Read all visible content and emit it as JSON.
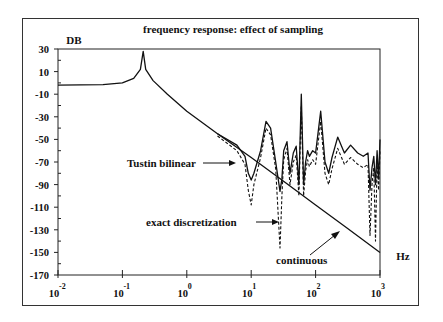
{
  "chart_data": {
    "type": "line",
    "title": "frequency response: effect of sampling",
    "ylabel": "DB",
    "xlabel": "Hz",
    "xscale": "log",
    "xlim": [
      0.01,
      1000
    ],
    "ylim": [
      -170,
      30
    ],
    "y_ticks": [
      30,
      10,
      -10,
      -30,
      -50,
      -70,
      -90,
      -110,
      -130,
      -150,
      -170
    ],
    "x_ticks": [
      {
        "base": "10",
        "exp": "-2"
      },
      {
        "base": "10",
        "exp": "-1"
      },
      {
        "base": "10",
        "exp": "0"
      },
      {
        "base": "10",
        "exp": "1"
      },
      {
        "base": "10",
        "exp": "2"
      },
      {
        "base": "10",
        "exp": "3"
      }
    ],
    "grid": false,
    "annotations": [
      {
        "text": "Tustin bilinear",
        "points_to": "Tustin bilinear curve near 8 Hz"
      },
      {
        "text": "exact discretization",
        "points_to": "dashed curve near 30 Hz"
      },
      {
        "text": "continuous",
        "points_to": "straight roll-off line near 300 Hz"
      }
    ],
    "series": [
      {
        "name": "continuous",
        "style": "solid",
        "x": [
          0.01,
          0.05,
          0.1,
          0.15,
          0.19,
          0.21,
          0.23,
          0.3,
          0.5,
          1,
          3,
          10,
          30,
          100,
          300,
          1000
        ],
        "y": [
          -2,
          -1.5,
          0,
          4,
          12,
          28,
          12,
          2,
          -10,
          -25,
          -45,
          -66,
          -86,
          -108,
          -128,
          -150
        ]
      },
      {
        "name": "Tustin bilinear",
        "style": "solid",
        "x": [
          3,
          6,
          8,
          9,
          10,
          11,
          14,
          17,
          20,
          24,
          28,
          30,
          32,
          36,
          40,
          45,
          50,
          55,
          60,
          65,
          70,
          75,
          80,
          90,
          100,
          120,
          140,
          160,
          180,
          220,
          280,
          350,
          450,
          550,
          650,
          700,
          750,
          800,
          850,
          900,
          950,
          1000
        ],
        "y": [
          -45,
          -55,
          -65,
          -80,
          -86,
          -80,
          -60,
          -34,
          -40,
          -70,
          -96,
          -85,
          -60,
          -52,
          -80,
          -62,
          -56,
          -90,
          -10,
          -90,
          -70,
          -60,
          -65,
          -60,
          -62,
          -25,
          -70,
          -80,
          -66,
          -48,
          -62,
          -55,
          -62,
          -65,
          -62,
          -95,
          -75,
          -65,
          -90,
          -60,
          -85,
          -50
        ]
      },
      {
        "name": "exact discretization",
        "style": "dashed",
        "x": [
          3,
          6,
          8,
          9,
          10,
          11,
          14,
          17,
          20,
          24,
          28,
          30,
          32,
          36,
          40,
          45,
          50,
          55,
          60,
          65,
          70,
          75,
          80,
          90,
          100,
          120,
          140,
          160,
          180,
          220,
          280,
          350,
          450,
          550,
          650,
          700,
          750,
          800,
          850,
          900,
          950,
          1000
        ],
        "y": [
          -47,
          -60,
          -72,
          -95,
          -108,
          -90,
          -66,
          -40,
          -46,
          -76,
          -146,
          -100,
          -68,
          -58,
          -90,
          -70,
          -64,
          -100,
          -20,
          -100,
          -78,
          -68,
          -74,
          -68,
          -72,
          -34,
          -80,
          -90,
          -76,
          -58,
          -72,
          -66,
          -72,
          -75,
          -72,
          -135,
          -90,
          -75,
          -140,
          -70,
          -95,
          -60
        ]
      }
    ]
  }
}
